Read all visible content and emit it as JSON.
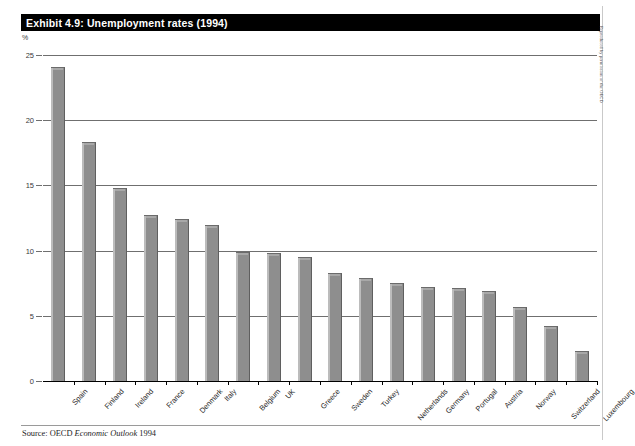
{
  "exhibit": {
    "title": "Exhibit 4.9: Unemployment rates (1994)",
    "source_prefix": "Source: OECD",
    "source_italic": "Economic Outlook",
    "source_suffix": "1994",
    "credit": "Reproduced by permission of the OECD"
  },
  "colors": {
    "title_bar_bg": "#000000",
    "title_bar_text": "#ffffff",
    "bar_fill": "#8e8e8e",
    "bar_highlight": "#bcbcbc",
    "bar_edge": "#5f5f5f",
    "gridline": "#6f6f6f",
    "axis": "#000000",
    "page_bg": "#ffffff"
  },
  "chart_data": {
    "type": "bar",
    "title": "Exhibit 4.9: Unemployment rates (1994)",
    "xlabel": "",
    "ylabel": "%",
    "ylim": [
      0,
      25
    ],
    "yticks": [
      0,
      5,
      10,
      15,
      20,
      25
    ],
    "ytick_labels": [
      "0",
      "5",
      "10",
      "15",
      "20",
      "25"
    ],
    "grid": true,
    "grid_axis": "y",
    "legend": false,
    "legend_position": "none",
    "orientation": "vertical",
    "categories": [
      "Spain",
      "Finland",
      "Ireland",
      "France",
      "Denmark",
      "Italy",
      "Belgium",
      "UK",
      "Greece",
      "Sweden",
      "Turkey",
      "Netherlands",
      "Germany",
      "Portugal",
      "Austria",
      "Norway",
      "Switzerland",
      "Luxembourg"
    ],
    "values": [
      24.1,
      18.3,
      14.8,
      12.7,
      12.4,
      12.0,
      9.9,
      9.8,
      9.5,
      8.3,
      7.9,
      7.5,
      7.2,
      7.1,
      6.9,
      5.7,
      4.2,
      2.3
    ],
    "series": [
      {
        "name": "Unemployment rate",
        "values": [
          24.1,
          18.3,
          14.8,
          12.7,
          12.4,
          12.0,
          9.9,
          9.8,
          9.5,
          8.3,
          7.9,
          7.5,
          7.2,
          7.1,
          6.9,
          5.7,
          4.2,
          2.3
        ]
      }
    ]
  }
}
